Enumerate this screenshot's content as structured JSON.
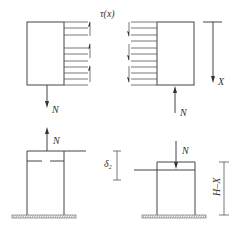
{
  "diagram": {
    "title": "",
    "panels": {
      "top_left": {
        "shear_label": "τ(x)",
        "force_label": "N",
        "force_direction": "down",
        "shear_direction": "up"
      },
      "top_right": {
        "force_label": "N",
        "force_direction": "up",
        "shear_direction": "down",
        "axis_label": "X"
      },
      "bottom_left": {
        "force_label": "N",
        "force_direction": "up",
        "displacement_label": "δ",
        "displacement_subscript": "2"
      },
      "bottom_right": {
        "force_label": "N",
        "force_direction": "down",
        "dimension_label": "H–X"
      }
    },
    "colors": {
      "line": "#444444",
      "background": "#ffffff",
      "ground_hatch": "#666666"
    }
  }
}
